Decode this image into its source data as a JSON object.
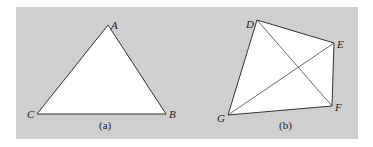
{
  "figure": {
    "background_color": "#cfcfcf",
    "shape_fill": "#ffffff",
    "stroke_color": "#333333",
    "panel_a": {
      "caption": "(a)",
      "shape": "triangle",
      "vertices": [
        {
          "label": "A",
          "x": 108,
          "y": 25
        },
        {
          "label": "B",
          "x": 166,
          "y": 114
        },
        {
          "label": "C",
          "x": 37,
          "y": 114
        }
      ]
    },
    "panel_b": {
      "caption": "(b)",
      "shape": "quadrilateral with diagonals",
      "vertices": [
        {
          "label": "D",
          "x": 257,
          "y": 20
        },
        {
          "label": "E",
          "x": 334,
          "y": 43
        },
        {
          "label": "F",
          "x": 332,
          "y": 106
        },
        {
          "label": "G",
          "x": 228,
          "y": 115
        }
      ],
      "diagonals": [
        "DF",
        "GE"
      ]
    }
  }
}
